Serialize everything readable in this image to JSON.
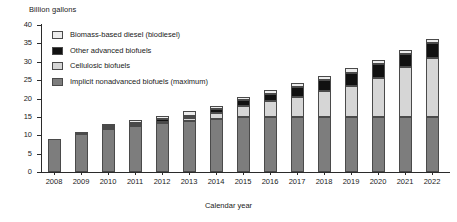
{
  "chart_data": {
    "type": "bar",
    "stacked": true,
    "title": "",
    "ylabel": "Billion gallons",
    "xlabel": "Calendar year",
    "ylim": [
      0,
      40
    ],
    "yticks": [
      0,
      5,
      10,
      15,
      20,
      25,
      30,
      35,
      40
    ],
    "grid": false,
    "legend_position": "upper-left-inside",
    "categories": [
      "2008",
      "2009",
      "2010",
      "2011",
      "2012",
      "2013",
      "2014",
      "2015",
      "2016",
      "2017",
      "2018",
      "2019",
      "2020",
      "2021",
      "2022"
    ],
    "series": [
      {
        "name": "Implicit nonadvanced biofuels (maximum)",
        "color": "#7d7d7d",
        "values": [
          9.0,
          10.5,
          12.0,
          12.6,
          13.2,
          13.8,
          14.4,
          15.0,
          15.0,
          15.0,
          15.0,
          15.0,
          15.0,
          15.0,
          15.0
        ]
      },
      {
        "name": "Cellulosic biofuels",
        "color": "#d6d6d6",
        "values": [
          0.0,
          0.0,
          0.1,
          0.25,
          0.5,
          1.0,
          1.75,
          3.0,
          4.25,
          5.5,
          7.0,
          8.5,
          10.5,
          13.5,
          16.0
        ]
      },
      {
        "name": "Other advanced biofuels",
        "color": "#111111",
        "values": [
          0.0,
          0.2,
          0.5,
          0.6,
          0.75,
          0.5,
          1.0,
          1.5,
          2.0,
          2.5,
          3.0,
          3.5,
          4.0,
          3.5,
          4.0
        ]
      },
      {
        "name": "Biomass-based diesel (biodiesel)",
        "color": "#ececec",
        "values": [
          0.0,
          0.2,
          0.4,
          0.65,
          0.8,
          1.2,
          0.85,
          1.0,
          1.0,
          1.2,
          1.2,
          1.4,
          1.0,
          1.2,
          1.2
        ]
      }
    ],
    "totals": [
      9.0,
      10.9,
      13.0,
      14.1,
      15.25,
      16.5,
      18.0,
      20.5,
      22.25,
      24.2,
      26.2,
      28.4,
      30.5,
      33.2,
      36.2
    ],
    "legend_entries": [
      {
        "label": "Biomass-based diesel (biodiesel)",
        "color": "#ececec"
      },
      {
        "label": "Other advanced biofuels",
        "color": "#111111"
      },
      {
        "label": "Cellulosic biofuels",
        "color": "#d6d6d6"
      },
      {
        "label": "Implicit nonadvanced biofuels (maximum)",
        "color": "#7d7d7d"
      }
    ]
  }
}
